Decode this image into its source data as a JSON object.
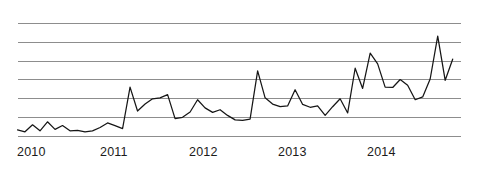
{
  "chart_data": {
    "type": "line",
    "title": "",
    "subtitle": "",
    "xlabel": "",
    "ylabel": "",
    "grid": true,
    "grid_orientation": "horizontal",
    "gridline_count": 7,
    "legend": false,
    "legend_position": "none",
    "axis_y_labels_shown": false,
    "xlim": [
      2010.0,
      2014.92
    ],
    "ylim": [
      0,
      7
    ],
    "y_gridline_values": [
      0,
      1,
      2,
      3,
      4,
      5,
      6
    ],
    "xticks": [
      "2010",
      "2011",
      "2012",
      "2013",
      "2014"
    ],
    "xtick_values": [
      2010,
      2011,
      2012,
      2013,
      2014
    ],
    "series": [
      {
        "name": "value",
        "color": "#161616",
        "x": [
          2010.0,
          2010.083,
          2010.167,
          2010.25,
          2010.333,
          2010.417,
          2010.5,
          2010.583,
          2010.667,
          2010.75,
          2010.833,
          2010.917,
          2011.0,
          2011.083,
          2011.167,
          2011.25,
          2011.333,
          2011.417,
          2011.5,
          2011.583,
          2011.667,
          2011.75,
          2011.833,
          2011.917,
          2012.0,
          2012.083,
          2012.167,
          2012.25,
          2012.333,
          2012.417,
          2012.5,
          2012.583,
          2012.667,
          2012.75,
          2012.833,
          2012.917,
          2013.0,
          2013.083,
          2013.167,
          2013.25,
          2013.333,
          2013.417,
          2013.5,
          2013.583,
          2013.667,
          2013.75,
          2013.833,
          2013.917,
          2014.0,
          2014.083,
          2014.167,
          2014.25,
          2014.333,
          2014.417,
          2014.5,
          2014.583,
          2014.667,
          2014.75,
          2014.833
        ],
        "values": [
          0.35,
          0.25,
          0.62,
          0.3,
          0.78,
          0.38,
          0.58,
          0.3,
          0.33,
          0.25,
          0.3,
          0.48,
          0.72,
          0.58,
          0.42,
          2.62,
          1.35,
          1.72,
          2.0,
          2.05,
          2.22,
          0.95,
          1.02,
          1.3,
          1.95,
          1.52,
          1.28,
          1.42,
          1.12,
          0.88,
          0.85,
          0.92,
          3.48,
          2.05,
          1.72,
          1.58,
          1.62,
          2.48,
          1.7,
          1.55,
          1.62,
          1.12,
          1.58,
          2.0,
          1.25,
          3.62,
          2.55,
          4.42,
          3.85,
          2.62,
          2.6,
          3.02,
          2.72,
          1.95,
          2.1,
          3.05,
          5.32,
          2.98,
          4.1
        ]
      }
    ],
    "series_end_value": 2.78
  },
  "axis": {
    "ticks": [
      {
        "label": "2010",
        "x_px": 17
      },
      {
        "label": "2011",
        "x_px": 100
      },
      {
        "label": "2012",
        "x_px": 189
      },
      {
        "label": "2013",
        "x_px": 278
      },
      {
        "label": "2014",
        "x_px": 367
      }
    ]
  },
  "style": {
    "background": "#ffffff",
    "grid_color": "#8d8d8d",
    "line_color": "#161616",
    "tick_label_color": "#1b1b1b"
  }
}
